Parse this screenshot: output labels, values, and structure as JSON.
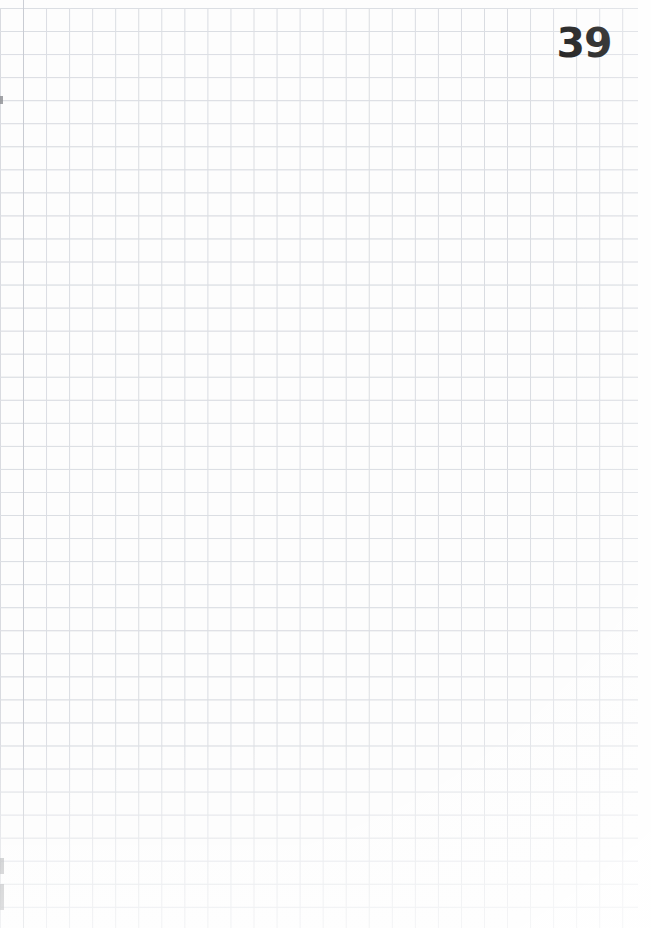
{
  "page": {
    "kind": "graph-paper-notebook-page",
    "width_px": 651,
    "height_px": 928,
    "page_number": "39",
    "background_color": "#fdfdfd"
  },
  "grid": {
    "cell_size_px": 23,
    "line_color": "#d6d9df",
    "margin_rule_color": "#c6cad1",
    "grid_left_px": 0,
    "grid_top_px": 8,
    "grid_right_px": 638,
    "left_margin_rule_x_px": 23,
    "right_margin_width_px": 13,
    "columns": 28,
    "rows": 40
  },
  "page_number_style": {
    "text": "39",
    "color": "#161616",
    "font_size_px": 41,
    "font_weight": "bold",
    "position": "top-right"
  },
  "artifacts": {
    "edge_marks_color": "#8d8f93",
    "count": 3
  }
}
